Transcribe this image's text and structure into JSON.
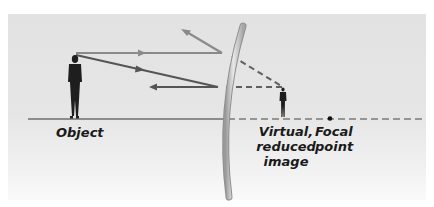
{
  "labels": {
    "object": "Object",
    "image_line1": "Virtual,",
    "image_line2": "reduced",
    "image_line3": "image",
    "focal_line1": "Focal",
    "focal_line2": "point"
  },
  "colors": {
    "background": "#e4e4e4",
    "ray_light": "#8a8a8a",
    "ray_dark": "#555555",
    "virtual_ray": "#5f5f5f",
    "axis": "#333333",
    "mirror": "#b8b8b8",
    "figure": "#1e1e1e"
  },
  "elements": {
    "mirror_type": "convex mirror",
    "object": "standing person",
    "image": "small standing person (virtual image)",
    "focal_point": "dot on principal axis"
  }
}
